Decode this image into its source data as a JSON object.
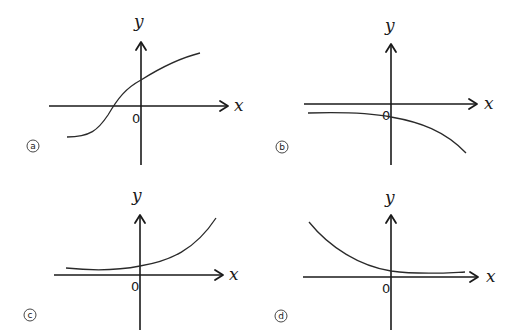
{
  "panels": [
    {
      "id": "a",
      "label": "a",
      "x_label": "x",
      "y_label": "y",
      "origin_label": "0",
      "description": "increasing S-shaped curve, negative horizontal asymptote on left, crosses x-axis left of origin, positive y-intercept"
    },
    {
      "id": "b",
      "label": "b",
      "x_label": "x",
      "y_label": "y",
      "origin_label": "0",
      "description": "decreasing curve below x-axis, nearly flat on left, dropping steeply on right, y-intercept slightly negative"
    },
    {
      "id": "c",
      "label": "c",
      "x_label": "x",
      "y_label": "y",
      "origin_label": "0",
      "description": "increasing exponential-like curve above x-axis, approaches x-axis on left, rises steeply on right"
    },
    {
      "id": "d",
      "label": "d",
      "x_label": "x",
      "y_label": "y",
      "origin_label": "0",
      "description": "decreasing exponential-like curve above x-axis, steep on left, approaches x-axis on right"
    }
  ],
  "colors": {
    "ink": "#1a1a1a",
    "background": "#ffffff"
  }
}
